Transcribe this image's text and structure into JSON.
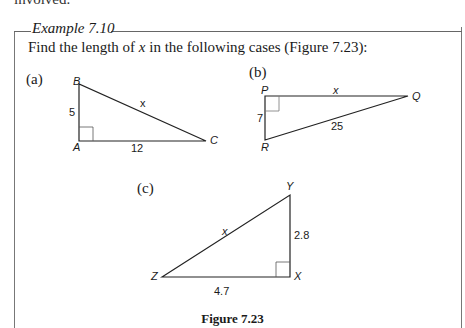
{
  "cut_text": "involved.",
  "example": {
    "title": "Example 7.10",
    "prompt_pre": "Find the length of ",
    "prompt_var": "x",
    "prompt_post": " in the following cases (Figure 7.23):"
  },
  "figures": {
    "a": {
      "label": "(a)",
      "vertices": {
        "B": "B",
        "A": "A",
        "C": "C"
      },
      "sides": {
        "AB": "5",
        "AC": "12",
        "BC": "x"
      }
    },
    "b": {
      "label": "(b)",
      "vertices": {
        "P": "P",
        "Q": "Q",
        "R": "R"
      },
      "sides": {
        "PQ": "x",
        "PR": "7",
        "RQ": "25"
      }
    },
    "c": {
      "label": "(c)",
      "vertices": {
        "Y": "Y",
        "Z": "Z",
        "X": "X"
      },
      "sides": {
        "ZY": "x",
        "YX": "2.8",
        "ZX": "4.7"
      }
    }
  },
  "caption": "Figure 7.23"
}
